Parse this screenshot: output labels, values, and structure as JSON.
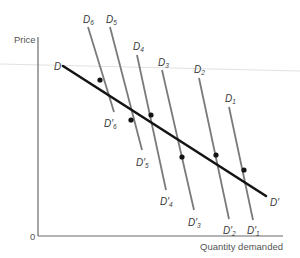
{
  "axes": {
    "y_label": "Price",
    "x_label": "Quantity demanded",
    "origin_label": "0"
  },
  "market_curve": {
    "start_label": "D",
    "end_label": "D′"
  },
  "individual_curves": [
    {
      "name": "D",
      "sub": "6",
      "prime": "D′",
      "psub": "6"
    },
    {
      "name": "D",
      "sub": "5",
      "prime": "D′",
      "psub": "5"
    },
    {
      "name": "D",
      "sub": "4",
      "prime": "D′",
      "psub": "4"
    },
    {
      "name": "D",
      "sub": "3",
      "prime": "D′",
      "psub": "3"
    },
    {
      "name": "D",
      "sub": "2",
      "prime": "D′",
      "psub": "2"
    },
    {
      "name": "D",
      "sub": "1",
      "prime": "D′",
      "psub": "1"
    }
  ],
  "colors": {
    "market_curve": "#141414",
    "individual_curves": "#7a7a7a",
    "axes": "#6a6a6a"
  }
}
